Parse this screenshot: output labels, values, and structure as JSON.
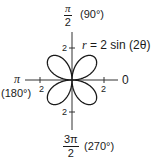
{
  "equation": {
    "lhs": "r",
    "rhs": "= 2 sin (2θ)"
  },
  "axes": {
    "top": {
      "num": "π",
      "den": "2",
      "deg": "(90°)"
    },
    "bottom": {
      "num": "3π",
      "den": "2",
      "deg": "(270°)"
    },
    "left": {
      "label": "π",
      "deg": "(180°)"
    },
    "right": {
      "label": "0"
    }
  },
  "ticks": {
    "top": "2",
    "bottom": "2",
    "left": "2",
    "right": "2"
  },
  "curve": {
    "type": "four-petal rose",
    "amplitude": 2,
    "k": 2
  }
}
